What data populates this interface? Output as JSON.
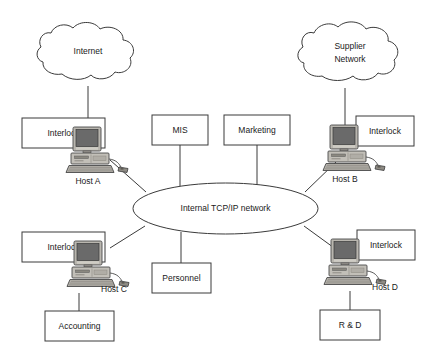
{
  "diagram": {
    "colors": {
      "stroke": "#3a3a3a",
      "background": "#ffffff",
      "text": "#1a1a1a",
      "screen": "#5a5a5a",
      "case": "#b8b5ae",
      "case_shade": "#8e8b84",
      "keyboard": "#a8a59e"
    },
    "clouds": [
      {
        "id": "internet",
        "label": "Internet"
      },
      {
        "id": "supplier-network",
        "label": "Supplier\nNetwork",
        "line1": "Supplier",
        "line2": "Network"
      }
    ],
    "network": {
      "label": "Internal TCP/IP network"
    },
    "hosts": [
      {
        "id": "host-a",
        "label": "Host A",
        "interlock": "Interlock"
      },
      {
        "id": "host-b",
        "label": "Host B",
        "interlock": "Interlock"
      },
      {
        "id": "host-c",
        "label": "Host C",
        "interlock": "Interlock"
      },
      {
        "id": "host-d",
        "label": "Host D",
        "interlock": "Interlock"
      }
    ],
    "departments": [
      {
        "id": "mis",
        "label": "MIS"
      },
      {
        "id": "marketing",
        "label": "Marketing"
      },
      {
        "id": "personnel",
        "label": "Personnel"
      },
      {
        "id": "accounting",
        "label": "Accounting"
      },
      {
        "id": "rnd",
        "label": "R & D"
      }
    ]
  }
}
